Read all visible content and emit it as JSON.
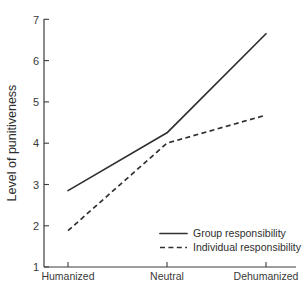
{
  "chart_data": {
    "type": "line",
    "title": "",
    "xlabel": "",
    "ylabel": "Level of punitiveness",
    "categories": [
      "Humanized",
      "Neutral",
      "Dehumanized"
    ],
    "ylim": [
      1,
      7
    ],
    "yticks": [
      1,
      2,
      3,
      4,
      5,
      6,
      7
    ],
    "ytick_labels": [
      "1",
      "2",
      "3",
      "4",
      "5",
      "6",
      "7"
    ],
    "grid": false,
    "legend_position": "bottom-right",
    "series": [
      {
        "name": "Group responsibility",
        "style": "solid",
        "values": [
          2.85,
          4.25,
          6.65
        ]
      },
      {
        "name": "Individual responsibility",
        "style": "dashed",
        "values": [
          1.88,
          4.0,
          4.68
        ]
      }
    ]
  },
  "axes": {
    "y_title": "Level of punitiveness",
    "y_tick_7": "7",
    "y_tick_6": "6",
    "y_tick_5": "5",
    "y_tick_4": "4",
    "y_tick_3": "3",
    "y_tick_2": "2",
    "y_tick_1": "1",
    "x_tick_1": "Humanized",
    "x_tick_2": "Neutral",
    "x_tick_3": "Dehumanized"
  },
  "legend": {
    "item_solid_label": "Group responsibility",
    "item_dashed_label": "Individual responsibility"
  },
  "colors": {
    "line": "#303030",
    "axis": "#3c3c3c",
    "text": "#2e2e2e",
    "background": "#ffffff"
  }
}
